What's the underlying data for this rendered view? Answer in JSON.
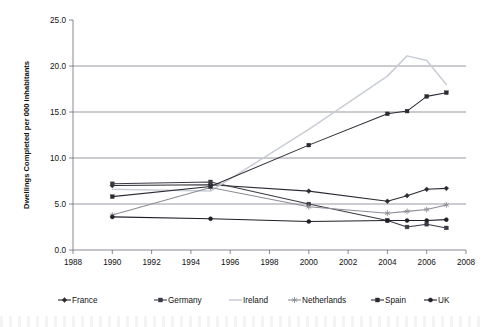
{
  "chart_data": {
    "type": "line",
    "title": "",
    "xlabel": "",
    "ylabel": "Dwellings Completed per 000 inhabitants",
    "xlim": [
      1988,
      2008
    ],
    "ylim": [
      0.0,
      25.0
    ],
    "xticks": [
      1988,
      1990,
      1992,
      1994,
      1996,
      1998,
      2000,
      2002,
      2004,
      2006,
      2008
    ],
    "yticks": [
      "0.0",
      "5.0",
      "10.0",
      "15.0",
      "20.0",
      "25.0"
    ],
    "ytick_values": [
      0.0,
      5.0,
      10.0,
      15.0,
      20.0,
      25.0
    ],
    "grid": "horizontal",
    "legend_position": "bottom",
    "series": [
      {
        "name": "France",
        "marker": "diamond",
        "color": "#2b2b33",
        "x": [
          1990,
          1995,
          2000,
          2004,
          2005,
          2006,
          2007
        ],
        "values": [
          7.0,
          7.1,
          6.4,
          5.3,
          5.9,
          6.6,
          6.7
        ]
      },
      {
        "name": "Germany",
        "marker": "square",
        "color": "#3a3a44",
        "x": [
          1990,
          1995,
          2000,
          2004,
          2005,
          2006,
          2007
        ],
        "values": [
          7.2,
          7.4,
          5.0,
          3.2,
          2.5,
          2.8,
          2.4
        ]
      },
      {
        "name": "Ireland",
        "marker": "none",
        "color": "#c9cdd6",
        "x": [
          1990,
          1995,
          2000,
          2004,
          2005,
          2006,
          2007
        ],
        "values": [
          6.6,
          6.4,
          13.1,
          18.9,
          21.1,
          20.6,
          18.0
        ]
      },
      {
        "name": "Netherlands",
        "marker": "asterisk",
        "color": "#8c8c96",
        "x": [
          1990,
          1995,
          2000,
          2004,
          2005,
          2006,
          2007
        ],
        "values": [
          3.8,
          6.8,
          4.7,
          4.0,
          4.2,
          4.4,
          4.9
        ]
      },
      {
        "name": "Spain",
        "marker": "square",
        "color": "#2b2b33",
        "x": [
          1990,
          1995,
          2000,
          2004,
          2005,
          2006,
          2007
        ],
        "values": [
          5.8,
          6.9,
          11.4,
          14.8,
          15.1,
          16.7,
          17.1
        ]
      },
      {
        "name": "UK",
        "marker": "circle",
        "color": "#1f1f27",
        "x": [
          1990,
          1995,
          2000,
          2004,
          2005,
          2006,
          2007
        ],
        "values": [
          3.6,
          3.4,
          3.1,
          3.2,
          3.2,
          3.2,
          3.3
        ]
      }
    ]
  },
  "legend": {
    "entries": [
      {
        "label": "France"
      },
      {
        "label": "Germany"
      },
      {
        "label": "Ireland"
      },
      {
        "label": "Netherlands"
      },
      {
        "label": "Spain"
      },
      {
        "label": "UK"
      }
    ]
  }
}
